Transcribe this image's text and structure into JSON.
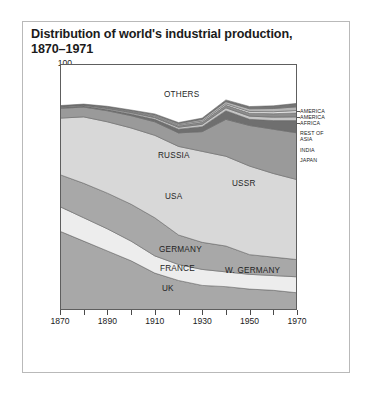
{
  "title": "Distribution of world's industrial production, 1870–1971",
  "title_line1": "Distribution of world's industrial production,",
  "title_line2": "1870–1971",
  "axis": {
    "ylabel": "Percentage share of world's industrial production",
    "yticks": [
      "10",
      "20",
      "30",
      "40",
      "50",
      "60",
      "70",
      "80",
      "90",
      "100"
    ],
    "xticks": [
      "1870",
      "1890",
      "1910",
      "1930",
      "1950",
      "1970"
    ]
  },
  "series_labels": {
    "others": "OTHERS",
    "russia": "RUSSIA",
    "usa": "USA",
    "ussr": "USSR",
    "germany": "GERMANY",
    "france": "FRANCE",
    "w_germany": "W. GERMANY",
    "uk": "UK"
  },
  "legend": {
    "items": [
      {
        "label": "AMERICA"
      },
      {
        "label": "AMERICA"
      },
      {
        "label": "AFRICA"
      },
      {
        "label": "REST OF"
      },
      {
        "label": "ASIA"
      },
      {
        "label": "INDIA"
      },
      {
        "label": "JAPAN"
      }
    ]
  },
  "colors": {
    "uk": "#a8a8a8",
    "france": "#ededed",
    "germany": "#a8a8a8",
    "usa": "#d8d8d8",
    "russia": "#9a9a9a",
    "japan": "#6f6f6f",
    "india": "#c6c6c6",
    "rest_of_asia": "#8d8d8d",
    "africa": "#e4e4e4",
    "america1": "#b5b5b5",
    "america2": "#757575",
    "others": "#ffffff",
    "frame": "#5e5e5e",
    "text": "#1b1b1b"
  },
  "chart_data": {
    "type": "area",
    "stacked": true,
    "title": "Distribution of world's industrial production, 1870–1971",
    "xlabel": "",
    "ylabel": "Percentage share of world's industrial production",
    "xlim": [
      1870,
      1970
    ],
    "ylim": [
      0,
      100
    ],
    "grid": false,
    "legend_position": "right",
    "note": "Stacked area; remaining space to 100% is labelled OTHERS (white).",
    "x": [
      1870,
      1880,
      1890,
      1900,
      1910,
      1920,
      1930,
      1940,
      1950,
      1960,
      1970
    ],
    "series": [
      {
        "name": "UK",
        "values": [
          32.0,
          28.0,
          24.0,
          20.0,
          15.0,
          12.0,
          10.0,
          9.5,
          8.5,
          8.0,
          7.0
        ]
      },
      {
        "name": "FRANCE",
        "values": [
          10.0,
          9.5,
          9.0,
          8.0,
          7.0,
          6.5,
          6.5,
          6.0,
          6.0,
          6.0,
          6.5
        ]
      },
      {
        "name": "GERMANY",
        "values": [
          13.0,
          14.0,
          14.5,
          15.0,
          15.5,
          12.0,
          11.0,
          10.5,
          8.0,
          7.5,
          7.0
        ]
      },
      {
        "name": "USA",
        "values": [
          23.0,
          27.0,
          29.0,
          31.0,
          33.5,
          36.0,
          37.0,
          36.5,
          36.0,
          34.0,
          32.5
        ]
      },
      {
        "name": "RUSSIA / USSR",
        "values": [
          4.0,
          4.0,
          4.5,
          5.0,
          5.5,
          5.5,
          8.0,
          15.0,
          16.5,
          18.0,
          19.0
        ]
      },
      {
        "name": "JAPAN",
        "values": [
          0.3,
          0.4,
          0.5,
          0.7,
          1.0,
          1.5,
          2.0,
          3.5,
          2.5,
          3.5,
          5.0
        ]
      },
      {
        "name": "INDIA",
        "values": [
          0.3,
          0.3,
          0.4,
          0.5,
          0.7,
          0.8,
          1.0,
          1.2,
          1.3,
          1.4,
          1.5
        ]
      },
      {
        "name": "REST OF ASIA",
        "values": [
          0.2,
          0.2,
          0.3,
          0.4,
          0.5,
          0.6,
          0.8,
          1.0,
          1.2,
          1.4,
          1.6
        ]
      },
      {
        "name": "AFRICA",
        "values": [
          0.1,
          0.1,
          0.2,
          0.2,
          0.3,
          0.4,
          0.5,
          0.6,
          0.7,
          0.8,
          1.0
        ]
      },
      {
        "name": "AMERICA",
        "values": [
          0.1,
          0.1,
          0.2,
          0.3,
          0.4,
          0.5,
          0.7,
          0.9,
          1.1,
          1.3,
          1.5
        ]
      },
      {
        "name": "AMERICA",
        "values": [
          0.1,
          0.1,
          0.2,
          0.2,
          0.3,
          0.4,
          0.5,
          0.7,
          0.9,
          1.1,
          1.4
        ]
      },
      {
        "name": "OTHERS",
        "values": [
          17.0,
          16.5,
          17.8,
          18.9,
          20.2,
          24.0,
          22.3,
          14.8,
          18.5,
          17.3,
          17.5
        ]
      }
    ]
  }
}
